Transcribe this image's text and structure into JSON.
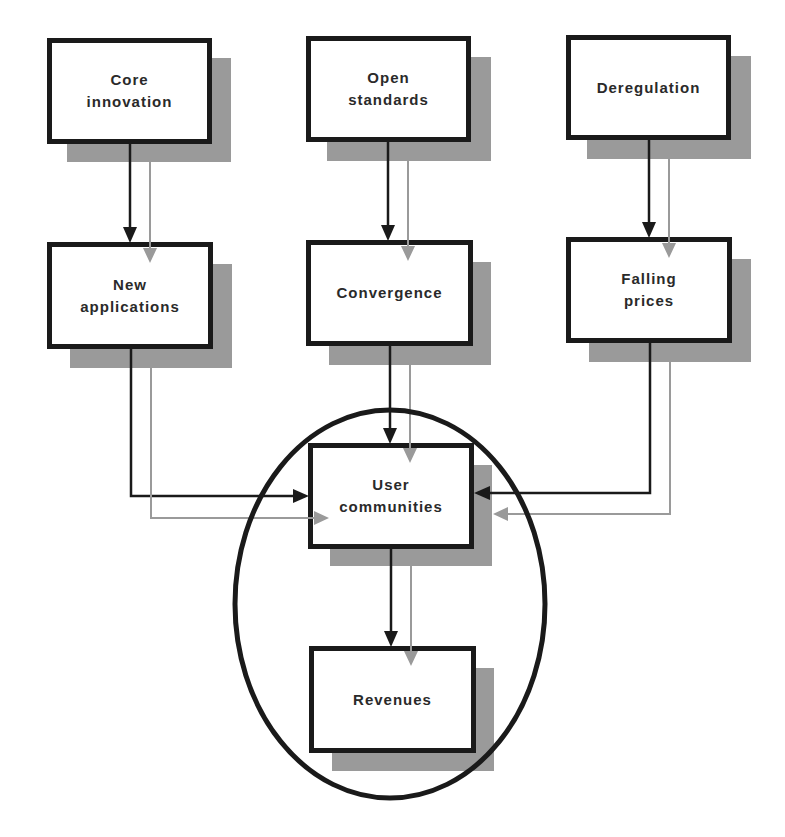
{
  "diagram": {
    "type": "flowchart",
    "colors": {
      "primary_arrow": "#1a1a1a",
      "secondary_arrow": "#9a9a9a",
      "shadow": "#9a9a9a",
      "box_border": "#1a1a1a",
      "ellipse": "#1a1a1a"
    },
    "nodes": {
      "core_innovation": {
        "label": "Core\ninnovation"
      },
      "open_standards": {
        "label": "Open\nstandards"
      },
      "deregulation": {
        "label": "Deregulation"
      },
      "new_applications": {
        "label": "New\napplications"
      },
      "convergence": {
        "label": "Convergence"
      },
      "falling_prices": {
        "label": "Falling\nprices"
      },
      "user_communities": {
        "label": "User\ncommunities"
      },
      "revenues": {
        "label": "Revenues"
      }
    },
    "edges": [
      {
        "from": "Core innovation",
        "to": "New applications"
      },
      {
        "from": "Open standards",
        "to": "Convergence"
      },
      {
        "from": "Deregulation",
        "to": "Falling prices"
      },
      {
        "from": "New applications",
        "to": "User communities"
      },
      {
        "from": "Convergence",
        "to": "User communities"
      },
      {
        "from": "Falling prices",
        "to": "User communities"
      },
      {
        "from": "User communities",
        "to": "Revenues"
      }
    ],
    "highlight": {
      "shape": "ellipse",
      "encloses": [
        "User communities",
        "Revenues"
      ]
    }
  }
}
